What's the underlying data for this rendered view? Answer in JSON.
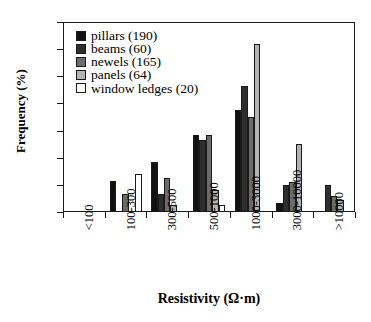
{
  "chart_data": {
    "type": "bar",
    "title": "",
    "xlabel": "Resistivity (Ω·m)",
    "ylabel": "Frequency (%)",
    "categories": [
      "<100",
      "100-300",
      "300-500",
      "500-1000",
      "1000-3000",
      "3000-10000",
      ">10000"
    ],
    "ylim": [
      0,
      70
    ],
    "yticks": [
      0,
      10,
      20,
      30,
      40,
      50,
      60,
      70
    ],
    "ytick_labels": [
      "0",
      "10",
      "20",
      "30",
      "40",
      "50",
      "60",
      "70"
    ],
    "grid": false,
    "legend_position": "top-left",
    "series": [
      {
        "name": "pillars (190)",
        "color": "#111111",
        "values": [
          0,
          11.5,
          18.5,
          28.5,
          37.5,
          3.5,
          0
        ]
      },
      {
        "name": "beams (60)",
        "color": "#2e2e2e",
        "values": [
          0,
          0,
          6.5,
          26.5,
          46.5,
          10.0,
          10.0
        ]
      },
      {
        "name": "newels (165)",
        "color": "#6b6b6b",
        "values": [
          0,
          6.5,
          12.5,
          28.5,
          35.0,
          11.0,
          6.0
        ]
      },
      {
        "name": "panels (64)",
        "color": "#b4b4b4",
        "values": [
          0,
          0,
          2.5,
          8.0,
          62.0,
          25.0,
          4.5
        ]
      },
      {
        "name": "window ledges (20)",
        "color": "#ffffff",
        "values": [
          0,
          14.0,
          0,
          2.5,
          0,
          0,
          0
        ]
      }
    ]
  },
  "axis": {
    "frame_color": "#1a1a1a"
  }
}
